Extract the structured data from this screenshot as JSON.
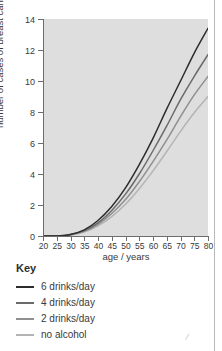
{
  "chart_data": {
    "type": "line",
    "title": "",
    "xlabel": "age / years",
    "ylabel": "number of cases of breast cancer per 100 women",
    "xlim": [
      20,
      80
    ],
    "ylim": [
      0,
      14
    ],
    "xticks": [
      20,
      25,
      30,
      35,
      40,
      45,
      50,
      55,
      60,
      65,
      70,
      75,
      80
    ],
    "yticks": [
      0,
      2,
      4,
      6,
      8,
      10,
      12,
      14
    ],
    "grid": false,
    "legend_position": "below-left",
    "legend_title": "Key",
    "x": [
      20,
      25,
      30,
      35,
      40,
      45,
      50,
      55,
      60,
      65,
      70,
      75,
      80
    ],
    "series": [
      {
        "name": "6 drinks/day",
        "color": "#2d2d2d",
        "values": [
          0,
          0,
          0.1,
          0.4,
          1.0,
          1.9,
          3.1,
          4.6,
          6.3,
          8.2,
          10.0,
          11.8,
          13.4
        ]
      },
      {
        "name": "4 drinks/day",
        "color": "#6b6b6b",
        "values": [
          0,
          0,
          0.1,
          0.35,
          0.85,
          1.65,
          2.7,
          4.0,
          5.5,
          7.1,
          8.8,
          10.3,
          11.7
        ]
      },
      {
        "name": "2 drinks/day",
        "color": "#8f8f8f",
        "values": [
          0,
          0,
          0.08,
          0.3,
          0.75,
          1.45,
          2.35,
          3.5,
          4.8,
          6.2,
          7.7,
          9.1,
          10.3
        ]
      },
      {
        "name": "no alcohol",
        "color": "#b4b4b4",
        "values": [
          0,
          0,
          0.07,
          0.25,
          0.65,
          1.25,
          2.05,
          3.05,
          4.2,
          5.45,
          6.75,
          7.95,
          9.0
        ]
      }
    ]
  },
  "legend": {
    "title": "Key",
    "items": [
      {
        "label": "6 drinks/day",
        "color": "#2d2d2d"
      },
      {
        "label": "4 drinks/day",
        "color": "#6b6b6b"
      },
      {
        "label": "2 drinks/day",
        "color": "#8f8f8f"
      },
      {
        "label": "no alcohol",
        "color": "#b4b4b4"
      }
    ]
  },
  "axes": {
    "y_title": "number of cases of breast cancer per 100 women",
    "x_title": "age / years"
  },
  "colors": {
    "plot_background": "#dedede",
    "page_background": "#ffffff",
    "axis": "#6d6d6d",
    "text": "#3a3a3a"
  }
}
